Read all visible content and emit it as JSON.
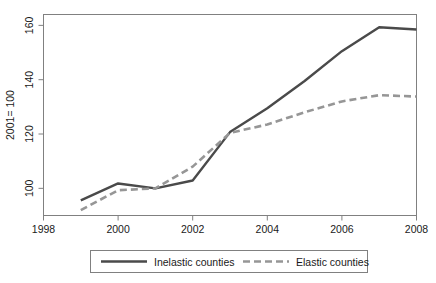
{
  "chart_data": {
    "type": "line",
    "title": "",
    "subtitle": "",
    "xlabel": "",
    "ylabel": "2001= 100",
    "xlim": [
      1998,
      2008
    ],
    "ylim": [
      90,
      164
    ],
    "grid": false,
    "legend_position": "bottom",
    "x": [
      1999,
      2000,
      2001,
      2002,
      2003,
      2004,
      2005,
      2006,
      2007,
      2008
    ],
    "xticks": [
      1998,
      2000,
      2002,
      2004,
      2006,
      2008
    ],
    "xtick_labels": [
      "1998",
      "2000",
      "2002",
      "2004",
      "2006",
      "2008"
    ],
    "yticks": [
      100,
      120,
      140,
      160
    ],
    "ytick_labels": [
      "100",
      "120",
      "140",
      "160"
    ],
    "series": [
      {
        "name": "Inelastic counties",
        "style": "solid",
        "color": "#4a4a4a",
        "values": [
          95.6,
          101.8,
          100.0,
          102.9,
          120.7,
          129.5,
          139.5,
          150.5,
          159.3,
          158.5
        ]
      },
      {
        "name": "Elastic counties",
        "style": "dashed",
        "color": "#969696",
        "values": [
          92.0,
          99.3,
          100.0,
          108.0,
          120.4,
          123.5,
          128.0,
          132.0,
          134.3,
          133.8
        ]
      }
    ]
  },
  "axes": {
    "ylabel": "2001= 100",
    "xtick_labels": [
      "1998",
      "2000",
      "2002",
      "2004",
      "2006",
      "2008"
    ],
    "ytick_labels": [
      "100",
      "120",
      "140",
      "160"
    ]
  },
  "legend": {
    "entries": [
      {
        "label": "Inelastic counties",
        "style": "solid",
        "color": "#4a4a4a"
      },
      {
        "label": "Elastic counties",
        "style": "dashed",
        "color": "#969696"
      }
    ]
  },
  "colors": {
    "inelastic": "#4a4a4a",
    "elastic": "#969696",
    "frame": "#808080",
    "text": "#1a1a1a"
  }
}
